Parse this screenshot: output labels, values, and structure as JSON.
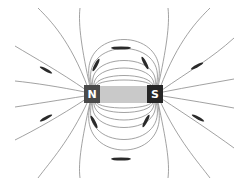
{
  "diagram": {
    "type": "magnetic-field-lines-bar-magnet",
    "magnet": {
      "north_label": "N",
      "south_label": "S",
      "north_color": "#4a4a4a",
      "south_color": "#262626",
      "body_color": "#c9c9c9"
    },
    "line_color": "#8a8a8a",
    "arrow_color": "#2a2a2a"
  }
}
